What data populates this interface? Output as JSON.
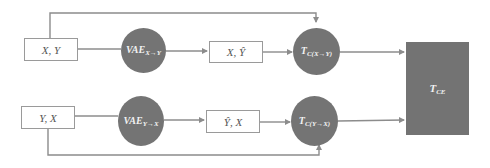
{
  "diagram": {
    "type": "flow",
    "colors": {
      "node_fill": "#747474",
      "node_text": "#f2f2f2",
      "box_border": "#9a9a9a",
      "box_text": "#555555",
      "edge": "#8c8c8c"
    },
    "top_row": {
      "input_box": {
        "label": "X, Y"
      },
      "vae": {
        "label": "VAE",
        "sub": "X→Y"
      },
      "output_box": {
        "label": "X, Ŷ"
      },
      "classifier": {
        "label": "T",
        "sub": "C(X→Y)"
      }
    },
    "bottom_row": {
      "input_box": {
        "label": "Y, X"
      },
      "vae": {
        "label": "VAE",
        "sub": "Y→X"
      },
      "output_box": {
        "label": "Ŷ, X"
      },
      "classifier": {
        "label": "T",
        "sub": "C(Y→X)"
      }
    },
    "combiner": {
      "label": "T",
      "sub": "CE"
    },
    "edges": [
      {
        "from": "X, Y",
        "to": "VAE X→Y"
      },
      {
        "from": "VAE X→Y",
        "to": "X, Ŷ"
      },
      {
        "from": "X, Ŷ",
        "to": "T C(X→Y)"
      },
      {
        "from": "X, Y",
        "to": "T C(X→Y)",
        "route": "bypass-top"
      },
      {
        "from": "T C(X→Y)",
        "to": "T CE"
      },
      {
        "from": "Y, X",
        "to": "VAE Y→X"
      },
      {
        "from": "VAE Y→X",
        "to": "Ŷ, X"
      },
      {
        "from": "Ŷ, X",
        "to": "T C(Y→X)"
      },
      {
        "from": "Y, X",
        "to": "T C(Y→X)",
        "route": "bypass-bottom"
      },
      {
        "from": "T C(Y→X)",
        "to": "T CE"
      }
    ]
  }
}
